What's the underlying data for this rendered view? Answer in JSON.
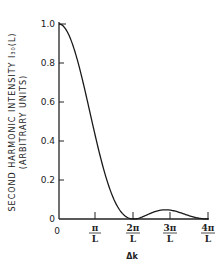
{
  "chart_data": {
    "type": "line",
    "title": "",
    "xlabel": "Δk",
    "ylabel_line1": "SECOND HARMONIC INTENSITY I₃₀(L)",
    "ylabel_line2": "(ARBITRARY UNITS)",
    "x_ticks": [
      {
        "num": "0",
        "den": "",
        "value": 0
      },
      {
        "num": "π",
        "den": "L",
        "value": 1
      },
      {
        "num": "2π",
        "den": "L",
        "value": 2
      },
      {
        "num": "3π",
        "den": "L",
        "value": 3
      },
      {
        "num": "4π",
        "den": "L",
        "value": 4
      }
    ],
    "y_ticks": [
      "0",
      "0.2",
      "0.4",
      "0.6",
      "0.8",
      "1.0"
    ],
    "ylim": [
      0,
      1.0
    ],
    "xlim": [
      0,
      4
    ],
    "x_units": "π/L",
    "series": [
      {
        "name": "sinc²(ΔkL/2)",
        "x": [
          0,
          0.25,
          0.5,
          0.75,
          1.0,
          1.25,
          1.5,
          1.75,
          2.0,
          2.25,
          2.5,
          2.75,
          3.0,
          3.25,
          3.5,
          3.75,
          4.0
        ],
        "values": [
          1.0,
          0.95,
          0.81,
          0.62,
          0.41,
          0.22,
          0.09,
          0.02,
          0.0,
          0.01,
          0.03,
          0.045,
          0.045,
          0.035,
          0.017,
          0.004,
          0.0
        ]
      }
    ],
    "grid": false,
    "legend": null
  }
}
